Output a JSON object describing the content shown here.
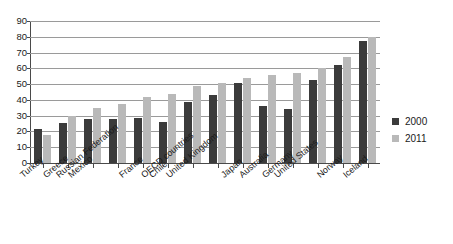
{
  "chart_data": {
    "type": "bar",
    "title": "",
    "subtitle": "",
    "xlabel": "",
    "ylabel": "",
    "ylim": [
      0,
      90
    ],
    "yticks": [
      0,
      10,
      20,
      30,
      40,
      50,
      60,
      70,
      80,
      90
    ],
    "grid": true,
    "legend_position": "right",
    "categories": [
      "Turkey",
      "Greece",
      "Mexico",
      "Russian Federation",
      "France",
      "Chile",
      "OECD countries",
      "United Kingdom",
      "Japan",
      "Australia",
      "Germany",
      "United States",
      "Norway",
      "Iceland"
    ],
    "series": [
      {
        "name": "2000",
        "color": "#3b3b3b",
        "values": [
          21.5,
          25.5,
          28.0,
          28.0,
          28.5,
          26.0,
          38.5,
          43.0,
          50.5,
          36.0,
          34.0,
          52.5,
          62.0,
          77.5
        ]
      },
      {
        "name": "2011",
        "color": "#b9b9b9",
        "values": [
          18.0,
          30.0,
          35.0,
          37.5,
          42.0,
          43.5,
          49.0,
          51.0,
          54.0,
          55.5,
          57.0,
          60.5,
          67.5,
          80.0
        ]
      }
    ]
  },
  "legend": {
    "items": [
      {
        "label": "2000",
        "swatch": "s2000"
      },
      {
        "label": "2011",
        "swatch": "s2011"
      }
    ]
  },
  "colors": {
    "series_2000": "#3b3b3b",
    "series_2011": "#b9b9b9",
    "axis": "#4a4a4a",
    "gridline": "#9a9a9a",
    "text": "#1a1a1a",
    "background": "#ffffff"
  }
}
